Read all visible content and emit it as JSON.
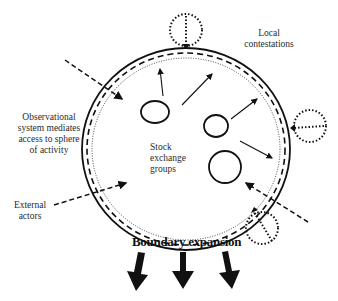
{
  "diagram": {
    "labels": {
      "local_contestations": [
        "Local",
        "contestations"
      ],
      "observational_system": [
        "Observational",
        "system mediates",
        "access to sphere",
        "of activity"
      ],
      "stock_exchange_groups": [
        "Stock",
        "exchange",
        "groups"
      ],
      "external_actors": [
        "External",
        "actors"
      ],
      "boundary_expansion": "Boundary expansion"
    },
    "colors": {
      "stroke": "#111111",
      "background": "#ffffff"
    }
  }
}
